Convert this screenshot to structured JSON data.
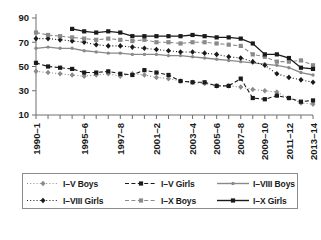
{
  "chart_data": {
    "type": "line",
    "title": "",
    "xlabel": "",
    "ylabel": "",
    "ylim": [
      10,
      90
    ],
    "yticks": [
      10,
      30,
      50,
      70,
      90
    ],
    "grid": false,
    "legend_position": "bottom",
    "x": [
      "1990-1",
      "1991-2",
      "1992-3",
      "1993-4",
      "1994-5",
      "1995-6",
      "1996-7",
      "1997-8",
      "1998-9",
      "1999-0",
      "2000-1",
      "2001-2",
      "2002-3",
      "2003-4",
      "2004-5",
      "2005-6",
      "2006-7",
      "2007-8",
      "2008-9",
      "2009-10",
      "2010-11",
      "2011-12",
      "2012-13",
      "2013-14"
    ],
    "xtick_labels": [
      "1990–1",
      "1995–6",
      "1997–8",
      "2001–2",
      "2003–4",
      "2005–6",
      "2007–8",
      "2009–10",
      "2011–12",
      "2013–14"
    ],
    "xtick_indices": [
      0,
      4,
      7,
      10,
      13,
      15,
      17,
      19,
      21,
      23
    ],
    "series": [
      {
        "name": "I–V Boys",
        "color": "#8a8a8a",
        "line_style": "dotted",
        "marker": "diamond",
        "values": [
          46,
          45,
          44,
          43,
          42,
          43,
          44,
          42,
          44,
          43,
          41,
          40,
          38,
          37,
          36,
          34,
          34,
          33,
          31,
          30,
          29,
          24,
          20,
          19
        ]
      },
      {
        "name": "I–V Girls",
        "color": "#1a1a1a",
        "line_style": "dashed",
        "marker": "square",
        "values": [
          53,
          50,
          49,
          48,
          45,
          45,
          46,
          44,
          43,
          47,
          45,
          43,
          38,
          37,
          37,
          34,
          34,
          40,
          24,
          23,
          26,
          24,
          21,
          22
        ]
      },
      {
        "name": "I–VIII Boys",
        "color": "#8a8a8a",
        "line_style": "solid",
        "marker": "dot",
        "values": [
          65,
          66,
          65,
          65,
          63,
          62,
          61,
          61,
          60,
          60,
          60,
          59,
          59,
          58,
          57,
          56,
          55,
          54,
          53,
          52,
          51,
          49,
          45,
          43
        ]
      },
      {
        "name": "I–VIII Girls",
        "color": "#1a1a1a",
        "line_style": "dotted",
        "marker": "diamond",
        "values": [
          73,
          73,
          72,
          71,
          70,
          68,
          67,
          67,
          66,
          65,
          64,
          63,
          62,
          62,
          61,
          60,
          58,
          57,
          54,
          51,
          44,
          41,
          39,
          37
        ]
      },
      {
        "name": "I–X Boys",
        "color": "#8a8a8a",
        "line_style": "dashed",
        "marker": "square",
        "values": [
          78,
          76,
          75,
          74,
          73,
          72,
          73,
          72,
          71,
          72,
          70,
          70,
          69,
          70,
          70,
          69,
          68,
          67,
          60,
          58,
          54,
          54,
          55,
          51
        ]
      },
      {
        "name": "I–X Girls",
        "color": "#1a1a1a",
        "line_style": "solid",
        "marker": "square",
        "values": [
          null,
          null,
          null,
          81,
          79,
          78,
          79,
          78,
          75,
          75,
          75,
          75,
          75,
          76,
          75,
          74,
          74,
          73,
          69,
          60,
          60,
          57,
          49,
          48
        ]
      }
    ]
  },
  "legend": {
    "items": [
      {
        "label": "I–V Boys",
        "series_index": 0
      },
      {
        "label": "I–V Girls",
        "series_index": 1
      },
      {
        "label": "I–VIII Boys",
        "series_index": 2
      },
      {
        "label": "I–VIII Girls",
        "series_index": 3
      },
      {
        "label": "I–X Boys",
        "series_index": 4
      },
      {
        "label": "I–X Girls",
        "series_index": 5
      }
    ]
  }
}
